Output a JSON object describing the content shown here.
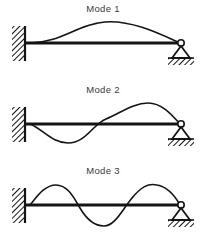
{
  "figure": {
    "background_color": "#ffffff",
    "line_color": "#141414",
    "text_color": "#3a3a3a",
    "width": 206,
    "height": 247
  },
  "supports": {
    "left": {
      "type": "fixed-wall",
      "label": "fixed-support",
      "hatching": "diagonal"
    },
    "right": {
      "type": "pinned-roller",
      "label": "pinned-support",
      "hatching": "diagonal"
    }
  },
  "modes": [
    {
      "label": "Mode 1",
      "half_waves": 1,
      "beam_y": 43,
      "span_x": [
        30,
        180
      ],
      "path": "M30,43 C60,43 78,24 105,22 C132,20 160,34 180,43",
      "description": "single upward hump peaking near mid-to-right span"
    },
    {
      "label": "Mode 2",
      "half_waves": 2,
      "beam_y": 43,
      "span_x": [
        30,
        180
      ],
      "path": "M30,43 C44,49 52,62 68,62 C86,62 92,44 106,38 C122,31 134,22 148,22 C162,22 172,34 180,43",
      "description": "downward lobe on left third, upward lobe on right half"
    },
    {
      "label": "Mode 3",
      "half_waves": 3,
      "beam_y": 43,
      "span_x": [
        30,
        180
      ],
      "path": "M30,43 C36,36 44,23 56,23 C68,23 74,36 80,46 C87,58 94,64 104,64 C115,64 122,48 132,36 C141,25 148,21 157,23 C168,25 175,34 180,43",
      "description": "three alternating lobes: up, down, up"
    }
  ],
  "chart_data": {
    "type": "line",
    "xlabel": "",
    "ylabel": "",
    "x": [
      0,
      0.1,
      0.2,
      0.3,
      0.4,
      0.5,
      0.6,
      0.7,
      0.8,
      0.9,
      1.0
    ],
    "series": [
      {
        "name": "Mode 1",
        "values": [
          0.0,
          0.22,
          0.52,
          0.78,
          0.94,
          1.0,
          0.97,
          0.85,
          0.63,
          0.35,
          0.0
        ]
      },
      {
        "name": "Mode 2",
        "values": [
          0.0,
          -0.45,
          -0.78,
          -0.88,
          -0.62,
          -0.18,
          0.38,
          0.8,
          0.96,
          0.72,
          0.0
        ]
      },
      {
        "name": "Mode 3",
        "values": [
          0.0,
          -0.62,
          -0.95,
          -0.7,
          -0.05,
          0.62,
          0.95,
          0.72,
          0.1,
          -0.55,
          0.0
        ]
      }
    ],
    "legend_position": "above-each-panel",
    "grid": false,
    "ylim": [
      -1,
      1
    ],
    "xlim": [
      0,
      1
    ]
  }
}
